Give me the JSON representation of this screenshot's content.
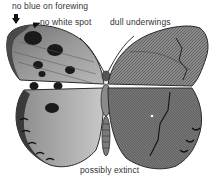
{
  "figure": {
    "annotations": [
      {
        "id": "blue",
        "text": "no blue on forewing"
      },
      {
        "id": "spot",
        "text": "no white spot"
      },
      {
        "id": "underwings",
        "text": "dull underwings"
      },
      {
        "id": "extinct",
        "text": "possibly extinct"
      }
    ]
  }
}
